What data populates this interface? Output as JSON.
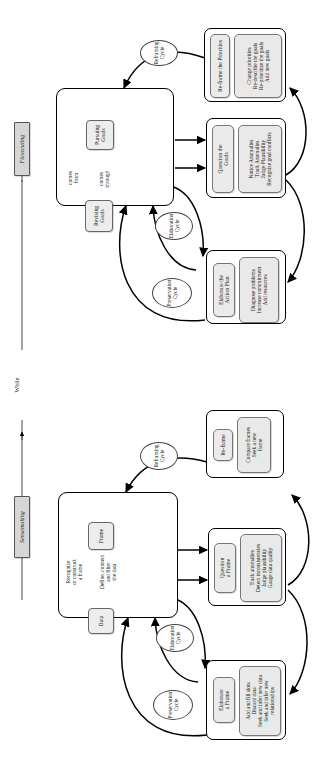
{
  "figure": {
    "orientation": "rotated-90-ccw",
    "axis_label": "While",
    "phases": [
      {
        "id": "flexecuting",
        "label": "Flexecuting"
      },
      {
        "id": "sensemaking",
        "label": "Sensemaking"
      }
    ]
  },
  "flexecuting": {
    "core": {
      "nodes": [
        {
          "id": "pursuing-goals",
          "label": "Pursuing\nGoals"
        },
        {
          "id": "revising-goals",
          "label": "Revising\nGoals"
        }
      ],
      "edge_labels": [
        {
          "id": "comes-from",
          "label": "comes\nfrom"
        },
        {
          "id": "comes-through",
          "label": "comes\nthrough"
        }
      ]
    },
    "cycles": [
      {
        "id": "reframing-cycle",
        "label": "Reframing\nCycle"
      },
      {
        "id": "elaboration-cycle",
        "label": "Elaboration\nCycle"
      },
      {
        "id": "preservation-cycle",
        "label": "Preservation\nCycle"
      }
    ],
    "activities": [
      {
        "id": "reframe-the-priorities",
        "title": "Re-frame the Priorities",
        "details": "Change priorities\nRe-describe the goals\nRe-prioritize the goals\nAdd new goals"
      },
      {
        "id": "question-the-goals",
        "title": "Question the\nGoals",
        "details": "Notice Anomalies\nTrack Anomalies\nJudge Plausibility\nRecognize goal conflicts"
      },
      {
        "id": "elaborate-the-action-plan",
        "title": "Elaborate the\nAction Plan",
        "details": "Diagnose problems\nIncrease commitment\nAdd resources"
      }
    ]
  },
  "sensemaking": {
    "core": {
      "nodes": [
        {
          "id": "frame",
          "label": "Frame"
        },
        {
          "id": "data",
          "label": "Data"
        }
      ],
      "edge_labels": [
        {
          "id": "recognize-or-construct-a-frame",
          "label": "Recognize\nor construct\na frame"
        },
        {
          "id": "define-connect-and-filter-the-data",
          "label": "Define, connect\nand filter\nthe data"
        }
      ]
    },
    "cycles": [
      {
        "id": "reframing-cycle",
        "label": "Reframing\nCycle"
      },
      {
        "id": "elaboration-cycle",
        "label": "Elaboration\nCycle"
      },
      {
        "id": "preservation-cycle",
        "label": "Preservation\nCycle"
      }
    ],
    "activities": [
      {
        "id": "re-frame",
        "title": "Re-frame",
        "details": "Compare frames\nSeek a new\nframe"
      },
      {
        "id": "question-a-frame",
        "title": "Question\na Frame",
        "details": "Track anomalies\nDetect inconsistencies\nJudge plausibility\nGauge data quality"
      },
      {
        "id": "elaborate-a-frame",
        "title": "Elaborate\na Frame",
        "details": "Add and fill slots\nDiscard data\nSeek and infer new data\nSeek and infer new\nrelationships"
      }
    ]
  },
  "colors": {
    "stroke": "#000000",
    "chip_fill": "#ebebeb",
    "phase_fill": "#d6d6d6",
    "page": "#ffffff"
  }
}
